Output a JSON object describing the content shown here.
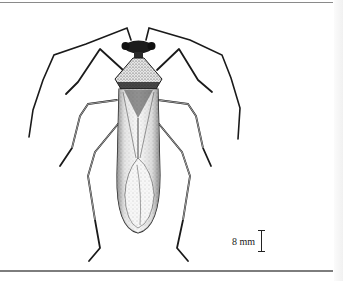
{
  "figure": {
    "style": "stippled pen-and-ink drawing",
    "colors": {
      "ink": "#1a1a1a",
      "background": "#ffffff",
      "rule": "#8a8a8a"
    }
  },
  "scale_bar": {
    "label": "8 mm"
  }
}
